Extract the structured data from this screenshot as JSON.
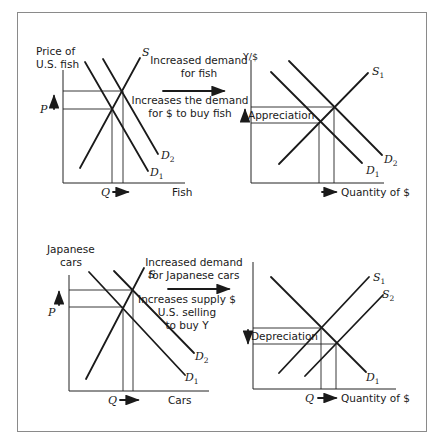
{
  "figure": {
    "top_left": {
      "y_label_line1": "Price of",
      "y_label_line2": "U.S. fish",
      "x_label": "Fish",
      "price_label": "P",
      "quantity_label": "Q",
      "supply_label": "S",
      "demand1_label": "D",
      "demand1_sub": "1",
      "demand2_label": "D",
      "demand2_sub": "2"
    },
    "top_middle": {
      "line1": "Increased demand",
      "line2": "for fish",
      "line3": "Increases the demand",
      "line4": "for $ to buy fish"
    },
    "top_right": {
      "y_label": "Y/$",
      "x_label": "Quantity of $",
      "change_label": "Appreciation",
      "supply_label": "S",
      "supply_sub": "1",
      "demand1_label": "D",
      "demand1_sub": "1",
      "demand2_label": "D",
      "demand2_sub": "2"
    },
    "bottom_left": {
      "y_label_line1": "Japanese",
      "y_label_line2": "cars",
      "x_label": "Cars",
      "price_label": "P",
      "quantity_label": "Q",
      "supply_label": "S",
      "demand1_label": "D",
      "demand1_sub": "1",
      "demand2_label": "D",
      "demand2_sub": "2"
    },
    "bottom_middle": {
      "line1": "Increased demand",
      "line2": "for Japanese cars",
      "line3": "Increases supply $",
      "line4": "U.S. selling",
      "line5": "to buy Y"
    },
    "bottom_right": {
      "quantity_label": "Q",
      "x_label": "Quantity of $",
      "change_label": "Depreciation",
      "supply1_label": "S",
      "supply1_sub": "1",
      "supply2_label": "S",
      "supply2_sub": "2",
      "demand1_label": "D",
      "demand1_sub": "1"
    }
  }
}
